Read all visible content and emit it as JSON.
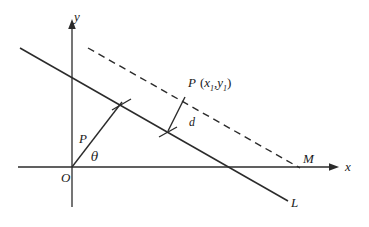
{
  "figure": {
    "type": "geometry-diagram",
    "background_color": "#ffffff",
    "stroke_color": "#2b2b2b",
    "axes": {
      "x_label": "x",
      "y_label": "y",
      "origin_label": "O"
    },
    "labels": {
      "line_L": "L",
      "point_M": "M",
      "point_P_normal_foot": "P",
      "angle_theta": "θ",
      "distance_d": "d",
      "point_P_name": "P",
      "coord_open": "(",
      "coord_x": "x",
      "coord_x_sub": "1",
      "coord_comma": ",",
      "coord_y": "y",
      "coord_y_sub": "1",
      "coord_close": ")"
    },
    "geometry": {
      "x_axis": {
        "x1": 18,
        "y1": 167,
        "x2": 336,
        "y2": 167
      },
      "y_axis": {
        "x1": 72,
        "y1": 207,
        "x2": 72,
        "y2": 22
      },
      "line_L": {
        "x1": 20,
        "y1": 48,
        "x2": 288,
        "y2": 201
      },
      "dashed_line": {
        "x1": 88,
        "y1": 48,
        "x2": 300,
        "y2": 168
      },
      "normal_OP": {
        "x1": 72,
        "y1": 167,
        "x2": 122,
        "y2": 102
      },
      "distance_d": {
        "x1": 168,
        "y1": 131,
        "x2": 185,
        "y2": 97
      },
      "tick_L_d": {
        "x1": 160,
        "y1": 136,
        "x2": 176,
        "y2": 127
      },
      "tick_L_op": {
        "x1": 113,
        "y1": 109,
        "x2": 129,
        "y2": 100
      }
    }
  }
}
